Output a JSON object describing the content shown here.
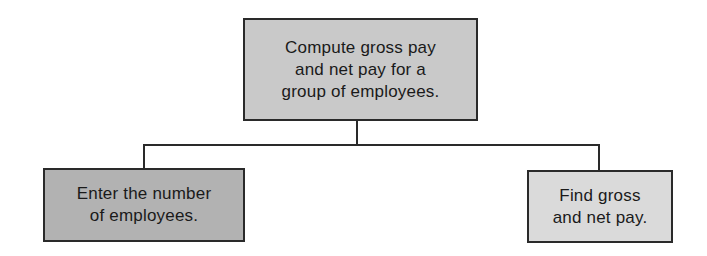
{
  "diagram": {
    "type": "hierarchy chart",
    "root": {
      "lines": [
        "Compute gross pay",
        "and net pay for a",
        "group of employees."
      ],
      "fill": "#c9c9c9"
    },
    "children": [
      {
        "lines": [
          "Enter the number",
          "of employees."
        ],
        "fill": "#b2b2b2"
      },
      {
        "lines": [
          "Find gross",
          "and net pay."
        ],
        "fill": "#dadada"
      }
    ],
    "line_color": "#2a2a2a",
    "border_color": "#2a2a2a"
  }
}
